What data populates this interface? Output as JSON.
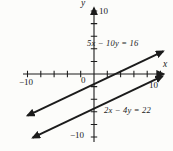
{
  "figure": {
    "background": "#fcfcfa",
    "ink_color": "#1b1b1b"
  },
  "axis_labels": {
    "x": "x",
    "y": "y",
    "origin": "0",
    "x_min": "−10",
    "x_max": "10",
    "y_min": "−10",
    "y_max": "10"
  },
  "equations": {
    "line1": "5x − 10y = 16",
    "line2": "2x − 4y = 22"
  },
  "chart_data": {
    "type": "line",
    "title": "",
    "xlabel": "x",
    "ylabel": "y",
    "xlim": [
      -10,
      10
    ],
    "ylim": [
      -10,
      10
    ],
    "tick_step": 2,
    "grid": false,
    "axis_number_labels": [
      -10,
      10
    ],
    "legend_position": "none",
    "annotations": [
      {
        "text": "5x − 10y = 16",
        "position": "above upper line, upper right quadrant"
      },
      {
        "text": "2x − 4y = 22",
        "position": "below lower line, lower right quadrant"
      }
    ],
    "series": [
      {
        "name": "5x − 10y = 16",
        "equation": "5x - 10y = 16",
        "slope": 0.5,
        "y_intercept": -1.6,
        "x_intercept": 3.2,
        "x_draw_range": [
          -10,
          10.4
        ],
        "arrowheads": "both"
      },
      {
        "name": "2x − 4y = 22",
        "equation": "2x - 4y = 22",
        "slope": 0.5,
        "y_intercept": -5.5,
        "x_intercept": 11,
        "x_draw_range": [
          -9.2,
          10.3
        ],
        "arrowheads": "both"
      }
    ]
  }
}
